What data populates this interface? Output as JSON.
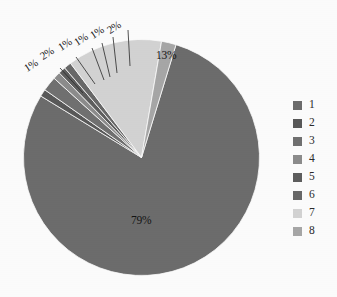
{
  "chart_data": {
    "type": "pie",
    "title": "",
    "labels": [
      "1",
      "2",
      "3",
      "4",
      "5",
      "6",
      "7",
      "8"
    ],
    "categories": [
      "1",
      "2",
      "3",
      "4",
      "5",
      "6",
      "7",
      "8"
    ],
    "values": [
      79,
      1,
      2,
      1,
      1,
      1,
      13,
      2
    ],
    "value_labels": [
      "79%",
      "1%",
      "2%",
      "1%",
      "1%",
      "1%",
      "13%",
      "2%"
    ],
    "colors": [
      "#6e6e6e",
      "#5a5a5a",
      "#727272",
      "#8e8e8e",
      "#5f5f5f",
      "#6a6a6a",
      "#d6d6d6",
      "#a9a9a9"
    ],
    "legend_position": "right",
    "grid": false,
    "units": "percent",
    "start_angle_deg": -73,
    "direction": "clockwise"
  },
  "legend": {
    "items": [
      {
        "label": "1",
        "color": "#6e6e6e"
      },
      {
        "label": "2",
        "color": "#5a5a5a"
      },
      {
        "label": "3",
        "color": "#727272"
      },
      {
        "label": "4",
        "color": "#8e8e8e"
      },
      {
        "label": "5",
        "color": "#5f5f5f"
      },
      {
        "label": "6",
        "color": "#6a6a6a"
      },
      {
        "label": "7",
        "color": "#d6d6d6"
      },
      {
        "label": "8",
        "color": "#a9a9a9"
      }
    ]
  },
  "callout_labels": [
    {
      "text": "1%",
      "x": 28,
      "y": 62
    },
    {
      "text": "2%",
      "x": 44,
      "y": 50
    },
    {
      "text": "1%",
      "x": 62,
      "y": 41
    },
    {
      "text": "1%",
      "x": 78,
      "y": 36
    },
    {
      "text": "1%",
      "x": 94,
      "y": 29
    },
    {
      "text": "2%",
      "x": 111,
      "y": 24
    }
  ],
  "inside_labels": [
    {
      "text": "13%",
      "x": 156,
      "y": 49
    },
    {
      "text": "79%",
      "x": 131,
      "y": 214
    }
  ]
}
